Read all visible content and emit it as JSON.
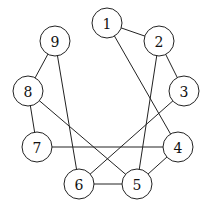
{
  "graph": {
    "node_radius": 15,
    "nodes": [
      {
        "id": "1",
        "label": "1",
        "x": 107,
        "y": 23
      },
      {
        "id": "2",
        "label": "2",
        "x": 159,
        "y": 41
      },
      {
        "id": "3",
        "label": "3",
        "x": 184,
        "y": 91
      },
      {
        "id": "4",
        "label": "4",
        "x": 178,
        "y": 147
      },
      {
        "id": "5",
        "label": "5",
        "x": 137,
        "y": 184
      },
      {
        "id": "6",
        "label": "6",
        "x": 79,
        "y": 184
      },
      {
        "id": "7",
        "label": "7",
        "x": 37,
        "y": 147
      },
      {
        "id": "8",
        "label": "8",
        "x": 28,
        "y": 91
      },
      {
        "id": "9",
        "label": "9",
        "x": 55,
        "y": 41
      }
    ],
    "edges": [
      [
        "1",
        "2"
      ],
      [
        "1",
        "4"
      ],
      [
        "2",
        "3"
      ],
      [
        "2",
        "5"
      ],
      [
        "3",
        "6"
      ],
      [
        "4",
        "5"
      ],
      [
        "4",
        "7"
      ],
      [
        "5",
        "6"
      ],
      [
        "5",
        "8"
      ],
      [
        "6",
        "9"
      ],
      [
        "7",
        "8"
      ],
      [
        "8",
        "9"
      ]
    ]
  }
}
